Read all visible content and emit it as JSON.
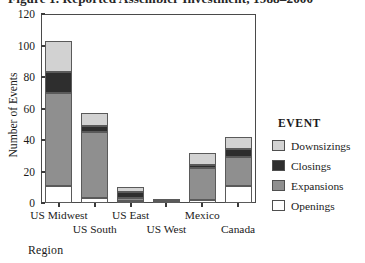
{
  "figure": {
    "title": "Figure 1. Reported Assembler Investment, 1988–2000"
  },
  "axis": {
    "ylabel": "Number of Events",
    "xlabel": "Region"
  },
  "legend": {
    "title": "EVENT",
    "entries": [
      {
        "label": "Downsizings",
        "color": "#d2d2d2"
      },
      {
        "label": "Closings",
        "color": "#2e2e2e"
      },
      {
        "label": "Expansions",
        "color": "#8f8f8f"
      },
      {
        "label": "Openings",
        "color": "#ffffff"
      }
    ]
  },
  "chart_data": {
    "type": "bar",
    "subtype": "stacked-vertical",
    "title": "Figure 1. Reported Assembler Investment, 1988–2000",
    "xlabel": "Region",
    "ylabel": "Number of Events",
    "ylim": [
      0,
      120
    ],
    "yticks": [
      0,
      20,
      40,
      60,
      80,
      100,
      120
    ],
    "grid": false,
    "legend_position": "right",
    "legend_title": "EVENT",
    "categories": [
      "US Midwest",
      "US South",
      "US East",
      "US West",
      "Mexico",
      "Canada"
    ],
    "series": [
      {
        "name": "Openings",
        "color": "#ffffff",
        "values": [
          11,
          3,
          1,
          0,
          2,
          11
        ]
      },
      {
        "name": "Expansions",
        "color": "#8f8f8f",
        "values": [
          59,
          42,
          2,
          1,
          20,
          18
        ]
      },
      {
        "name": "Closings",
        "color": "#2e2e2e",
        "values": [
          13,
          4,
          4,
          1,
          2,
          5
        ]
      },
      {
        "name": "Downsizings",
        "color": "#d2d2d2",
        "values": [
          20,
          8,
          3,
          0,
          8,
          8
        ]
      }
    ],
    "totals": [
      103,
      57,
      10,
      2,
      32,
      42
    ]
  },
  "yticks": [
    {
      "value": 120,
      "label": "120"
    },
    {
      "value": 100,
      "label": "100"
    },
    {
      "value": 80,
      "label": "80"
    },
    {
      "value": 60,
      "label": "60"
    },
    {
      "value": 40,
      "label": "40"
    },
    {
      "value": 20,
      "label": "20"
    },
    {
      "value": 0,
      "label": "0"
    }
  ]
}
